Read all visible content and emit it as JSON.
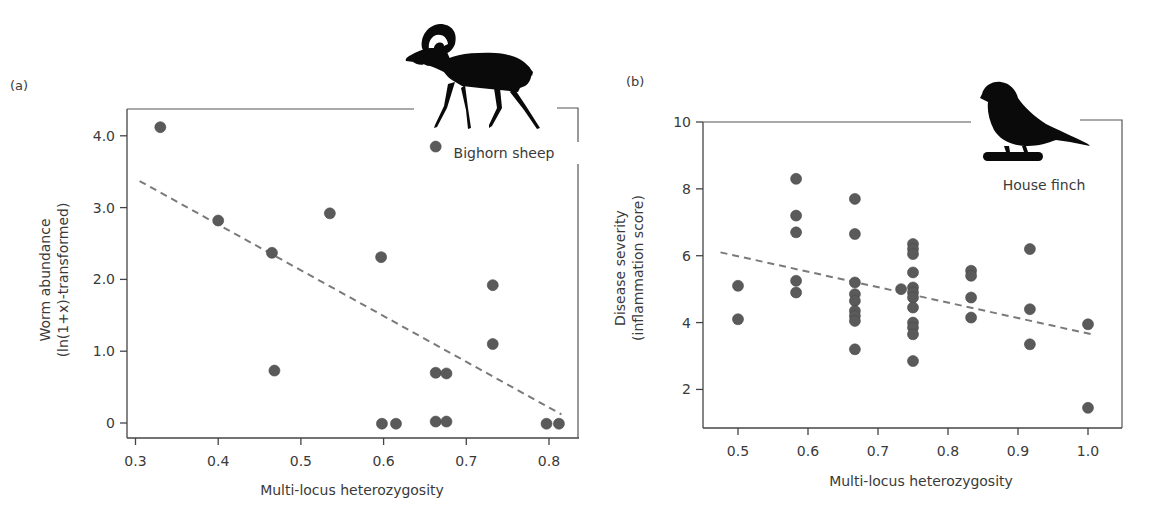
{
  "chart_data": [
    {
      "type": "scatter",
      "panel_label": "(a)",
      "species": "Bighorn sheep",
      "icon": "bighorn-sheep-silhouette",
      "title": "",
      "xlabel": "Multi-locus heterozygosity",
      "ylabel_line1": "Worm abundance",
      "ylabel_line2": "(ln(1+x)-transformed)",
      "xlim": [
        0.28,
        0.84
      ],
      "ylim": [
        -0.14,
        4.38
      ],
      "xticks": [
        0.3,
        0.4,
        0.5,
        0.6,
        0.7,
        0.8
      ],
      "xtick_labels": [
        "0.3",
        "0.4",
        "0.5",
        "0.6",
        "0.7",
        "0.8"
      ],
      "yticks": [
        0,
        1.0,
        2.0,
        3.0,
        4.0
      ],
      "ytick_labels": [
        "0",
        "1.0",
        "2.0",
        "3.0",
        "4.0"
      ],
      "grid": false,
      "points": [
        {
          "x": 0.33,
          "y": 4.12
        },
        {
          "x": 0.4,
          "y": 2.82
        },
        {
          "x": 0.465,
          "y": 2.37
        },
        {
          "x": 0.468,
          "y": 0.73
        },
        {
          "x": 0.535,
          "y": 2.92
        },
        {
          "x": 0.597,
          "y": 2.31
        },
        {
          "x": 0.598,
          "y": -0.01
        },
        {
          "x": 0.615,
          "y": -0.01
        },
        {
          "x": 0.663,
          "y": 3.85
        },
        {
          "x": 0.663,
          "y": 0.7
        },
        {
          "x": 0.676,
          "y": 0.69
        },
        {
          "x": 0.663,
          "y": 0.02
        },
        {
          "x": 0.676,
          "y": 0.02
        },
        {
          "x": 0.732,
          "y": 1.92
        },
        {
          "x": 0.732,
          "y": 1.1
        },
        {
          "x": 0.797,
          "y": -0.01
        },
        {
          "x": 0.812,
          "y": -0.01
        }
      ],
      "trendline": {
        "style": "dashed",
        "x": [
          0.305,
          0.815
        ],
        "y": [
          3.37,
          0.12
        ]
      }
    },
    {
      "type": "scatter",
      "panel_label": "(b)",
      "species": "House finch",
      "icon": "house-finch-silhouette",
      "title": "",
      "xlabel": "Multi-locus heterozygosity",
      "ylabel_line1": "Disease severity",
      "ylabel_line2": "(inflammation score)",
      "xlim": [
        0.455,
        1.05
      ],
      "ylim": [
        1.0,
        10.0
      ],
      "xticks": [
        0.5,
        0.6,
        0.7,
        0.8,
        0.9,
        1.0
      ],
      "xtick_labels": [
        "0.5",
        "0.6",
        "0.7",
        "0.8",
        "0.9",
        "1.0"
      ],
      "yticks": [
        2,
        4,
        6,
        8,
        10
      ],
      "ytick_labels": [
        "2",
        "4",
        "6",
        "8",
        "10"
      ],
      "grid": false,
      "points": [
        {
          "x": 0.5,
          "y": 5.1
        },
        {
          "x": 0.5,
          "y": 4.1
        },
        {
          "x": 0.583,
          "y": 8.3
        },
        {
          "x": 0.583,
          "y": 7.2
        },
        {
          "x": 0.583,
          "y": 6.7
        },
        {
          "x": 0.583,
          "y": 5.25
        },
        {
          "x": 0.583,
          "y": 4.9
        },
        {
          "x": 0.667,
          "y": 7.7
        },
        {
          "x": 0.667,
          "y": 6.65
        },
        {
          "x": 0.667,
          "y": 5.2
        },
        {
          "x": 0.667,
          "y": 4.85
        },
        {
          "x": 0.667,
          "y": 4.65
        },
        {
          "x": 0.667,
          "y": 4.35
        },
        {
          "x": 0.667,
          "y": 4.2
        },
        {
          "x": 0.667,
          "y": 4.05
        },
        {
          "x": 0.667,
          "y": 3.2
        },
        {
          "x": 0.733,
          "y": 5.0
        },
        {
          "x": 0.75,
          "y": 6.35
        },
        {
          "x": 0.75,
          "y": 6.2
        },
        {
          "x": 0.75,
          "y": 6.05
        },
        {
          "x": 0.75,
          "y": 5.5
        },
        {
          "x": 0.75,
          "y": 5.05
        },
        {
          "x": 0.75,
          "y": 4.9
        },
        {
          "x": 0.75,
          "y": 4.75
        },
        {
          "x": 0.75,
          "y": 4.45
        },
        {
          "x": 0.75,
          "y": 4.0
        },
        {
          "x": 0.75,
          "y": 3.85
        },
        {
          "x": 0.75,
          "y": 3.65
        },
        {
          "x": 0.75,
          "y": 2.85
        },
        {
          "x": 0.833,
          "y": 5.55
        },
        {
          "x": 0.833,
          "y": 5.4
        },
        {
          "x": 0.833,
          "y": 4.75
        },
        {
          "x": 0.833,
          "y": 4.15
        },
        {
          "x": 0.917,
          "y": 6.2
        },
        {
          "x": 0.917,
          "y": 4.4
        },
        {
          "x": 0.917,
          "y": 3.35
        },
        {
          "x": 1.0,
          "y": 3.95
        },
        {
          "x": 1.0,
          "y": 1.45
        }
      ],
      "trendline": {
        "style": "dashed",
        "x": [
          0.475,
          1.005
        ],
        "y": [
          6.1,
          3.65
        ]
      }
    }
  ]
}
